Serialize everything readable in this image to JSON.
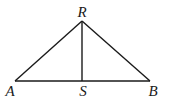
{
  "diagram": {
    "type": "triangle-with-altitude",
    "points": {
      "R": {
        "label": "R",
        "x": 82,
        "y": 21,
        "label_x": 82,
        "label_y": 17
      },
      "A": {
        "label": "A",
        "x": 15,
        "y": 81,
        "label_x": 10,
        "label_y": 96
      },
      "S": {
        "label": "S",
        "x": 82,
        "y": 81,
        "label_x": 83,
        "label_y": 96
      },
      "B": {
        "label": "B",
        "x": 150,
        "y": 81,
        "label_x": 153,
        "label_y": 96
      }
    },
    "segments": [
      "AR",
      "RB",
      "AB",
      "RS"
    ],
    "line_color": "#1a1a1a"
  }
}
